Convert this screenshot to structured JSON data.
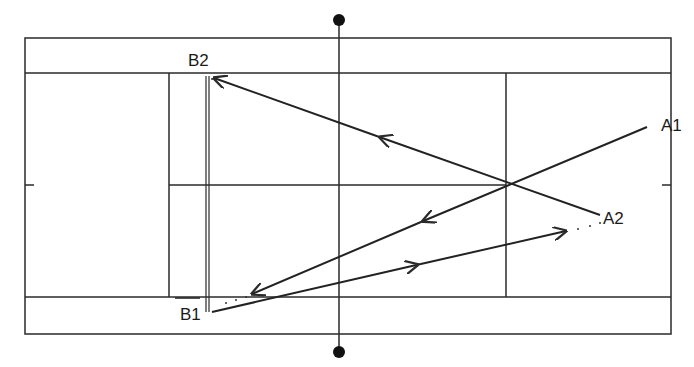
{
  "diagram": {
    "type": "tennis-court-shot-angles",
    "colors": {
      "line": "#2a2a2a",
      "background": "#ffffff"
    },
    "labels": {
      "a1": "A1",
      "a2": "A2",
      "b1": "B1",
      "b2": "B2"
    },
    "court": {
      "outer": {
        "x": 25,
        "y": 38,
        "w": 646,
        "h": 296
      },
      "alley_top_y": 73,
      "alley_bottom_y": 297,
      "service_line_left_x": 169,
      "service_line_right_x": 506,
      "center_service_y": 185,
      "net_x": 339,
      "net_post_top_y": 20,
      "net_post_bottom_y": 352
    },
    "shots": [
      {
        "name": "A2 to B2",
        "from": [
          600,
          215
        ],
        "to": [
          214,
          78
        ]
      },
      {
        "name": "A1 to B1",
        "from": [
          647,
          127
        ],
        "to": [
          252,
          294
        ]
      },
      {
        "name": "B1 to A2",
        "from": [
          212,
          312
        ],
        "to": [
          566,
          231
        ]
      }
    ]
  }
}
